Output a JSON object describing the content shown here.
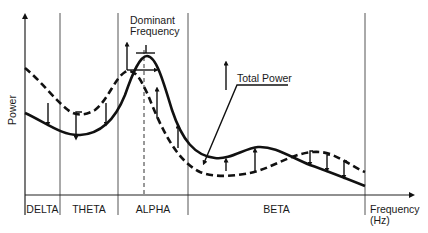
{
  "diagram": {
    "title": "",
    "axes": {
      "y_label": "Power",
      "x_label_line1": "Frequency",
      "x_label_line2": "(Hz)"
    },
    "bands": [
      {
        "name": "DELTA"
      },
      {
        "name": "THETA"
      },
      {
        "name": "ALPHA"
      },
      {
        "name": "BETA"
      }
    ],
    "annotations": {
      "dominant_line1": "Dominant",
      "dominant_line2": "Frequency",
      "total_power": "Total Power"
    },
    "legend": {
      "solid_curve": "Spectrum (state 1)",
      "dashed_curve": "Spectrum (state 2)"
    },
    "colors": {
      "line": "#111111",
      "grid": "#555555"
    }
  }
}
